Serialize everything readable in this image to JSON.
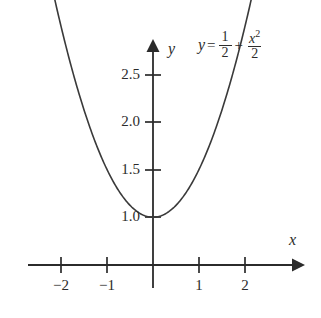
{
  "figure": {
    "background_color": "#ffffff",
    "ink_color": "#2b2b2b",
    "curve_color": "#3a3a3a"
  },
  "equation": {
    "lhs": "y",
    "equals": "=",
    "term1_numerator": "1",
    "term1_denominator": "2",
    "plus": "+",
    "term2_numerator": "x",
    "term2_numerator_exponent": "2",
    "term2_denominator": "2"
  },
  "axes": {
    "x_label": "x",
    "y_label": "y",
    "x_ticks": [
      {
        "value": -2,
        "label": "−2"
      },
      {
        "value": -1,
        "label": "−1"
      },
      {
        "value": 1,
        "label": "1"
      },
      {
        "value": 2,
        "label": "2"
      }
    ],
    "y_ticks": [
      {
        "value": 1.0,
        "label": "1.0"
      },
      {
        "value": 1.5,
        "label": "1.5"
      },
      {
        "value": 2.0,
        "label": "2.0"
      },
      {
        "value": 2.5,
        "label": "2.5"
      }
    ]
  },
  "chart_data": {
    "type": "line",
    "title": "",
    "subtitle": "",
    "xlabel": "x",
    "ylabel": "y",
    "annotations": [
      "y = 1/2 + x^2/2"
    ],
    "grid": false,
    "legend": null,
    "xlim": [
      -2.7,
      2.9
    ],
    "ylim": [
      -0.35,
      2.85
    ],
    "function": "y = 0.5 + x^2/2",
    "vertex": {
      "x": 0,
      "y": 0.5
    },
    "series": [
      {
        "name": "y = 1/2 + x^2/2",
        "color": "#3a3a3a",
        "x": [
          -2.4,
          -2.2,
          -2.0,
          -1.8,
          -1.6,
          -1.4,
          -1.2,
          -1.0,
          -0.8,
          -0.6,
          -0.4,
          -0.2,
          0.0,
          0.2,
          0.4,
          0.6,
          0.8,
          1.0,
          1.2,
          1.4,
          1.6,
          1.8,
          2.0,
          2.2,
          2.4
        ],
        "values": [
          3.38,
          2.92,
          2.5,
          2.12,
          1.78,
          1.48,
          1.22,
          1.0,
          0.82,
          0.68,
          0.58,
          0.52,
          0.5,
          0.52,
          0.58,
          0.68,
          0.82,
          1.0,
          1.22,
          1.48,
          1.78,
          2.12,
          2.5,
          2.92,
          3.38
        ]
      }
    ]
  }
}
